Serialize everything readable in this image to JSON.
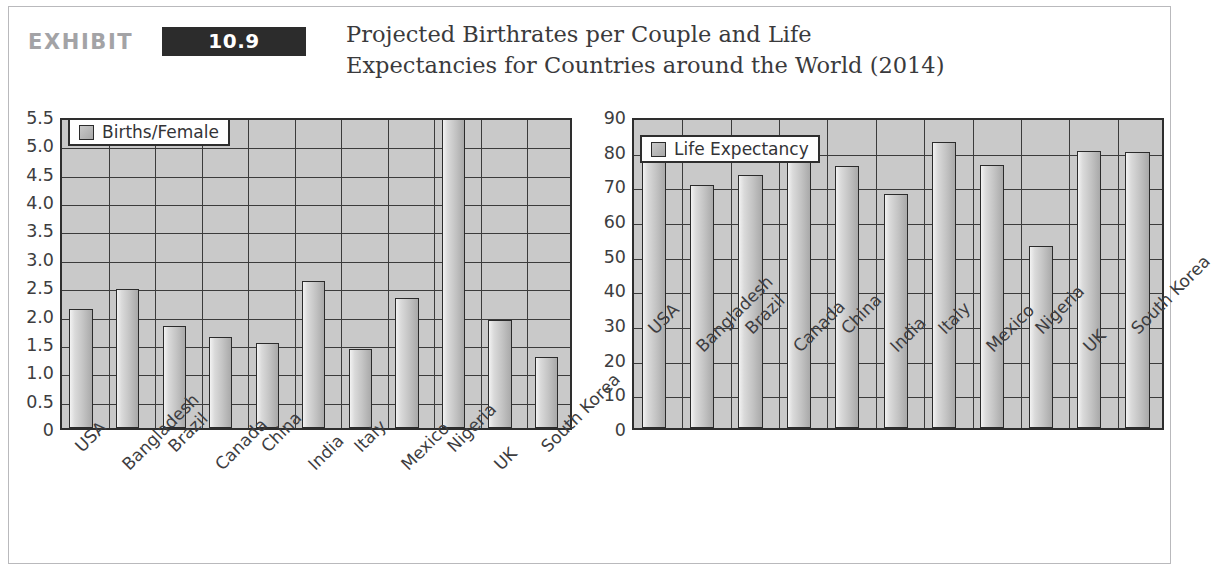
{
  "header": {
    "exhibit_word": "EXHIBIT",
    "exhibit_number": "10.9",
    "title_line1": "Projected Birthrates per Couple and Life",
    "title_line2": "Expectancies for Countries around the World (2014)",
    "number_box_color": "#2c2c2c",
    "exhibit_word_color": "#a3a3a6"
  },
  "chart_data": [
    {
      "type": "bar",
      "id": "births-per-female",
      "title": "",
      "legend": "Births/Female",
      "legend_position": "top-left-inside",
      "xlabel": "",
      "ylabel": "",
      "ylim": [
        0,
        5.5
      ],
      "grid": true,
      "categories": [
        "USA",
        "Bangladesh",
        "Brazil",
        "Canada",
        "China",
        "India",
        "Italy",
        "Mexico",
        "Nigeria",
        "UK",
        "South Korea"
      ],
      "values": [
        2.1,
        2.45,
        1.8,
        1.6,
        1.5,
        2.6,
        1.4,
        2.3,
        5.45,
        1.9,
        1.25
      ],
      "yticks": [
        "0",
        "0.5",
        "1.0",
        "1.5",
        "2.0",
        "2.5",
        "3.0",
        "3.5",
        "4.0",
        "4.5",
        "5.0",
        "5.5"
      ],
      "ytick_values": [
        0,
        0.5,
        1.0,
        1.5,
        2.0,
        2.5,
        3.0,
        3.5,
        4.0,
        4.5,
        5.0,
        5.5
      ]
    },
    {
      "type": "bar",
      "id": "life-expectancy",
      "title": "",
      "legend": "Life Expectancy",
      "legend_position": "top-left-inside",
      "xlabel": "",
      "ylabel": "",
      "ylim": [
        0,
        90
      ],
      "grid": true,
      "categories": [
        "USA",
        "Bangladesh",
        "Brazil",
        "Canada",
        "China",
        "India",
        "Italy",
        "Mexico",
        "Nigeria",
        "UK",
        "South Korea"
      ],
      "values": [
        78,
        70,
        73,
        81,
        75.5,
        67.5,
        82.5,
        76,
        52.5,
        80,
        79.5
      ],
      "yticks": [
        "0",
        "10",
        "20",
        "30",
        "40",
        "50",
        "60",
        "70",
        "80",
        "90"
      ],
      "ytick_values": [
        0,
        10,
        20,
        30,
        40,
        50,
        60,
        70,
        80,
        90
      ]
    }
  ]
}
